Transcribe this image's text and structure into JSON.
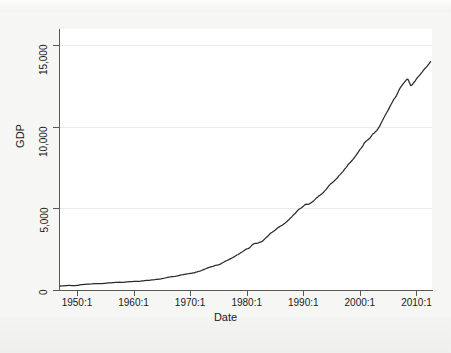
{
  "figure": {
    "background_color": "#f6f6f4",
    "plot_background_color": "#ffffff",
    "axis_color": "#585858",
    "grid_color": "#ececec",
    "line_color": "#2b2b2b"
  },
  "axis_titles": {
    "x": "Date",
    "y": "GDP"
  },
  "chart_data": {
    "type": "line",
    "title": "",
    "subtitle": "",
    "xlabel": "Date",
    "ylabel": "GDP",
    "xlim": [
      1947.0,
      2012.75
    ],
    "ylim": [
      0,
      16000
    ],
    "grid": true,
    "grid_axis": "y",
    "legend": false,
    "legend_position": "none",
    "x_tick_labels": [
      "1950:1",
      "1960:1",
      "1970:1",
      "1980:1",
      "1990:1",
      "2000:1",
      "2010:1"
    ],
    "x_tick_values": [
      1950,
      1960,
      1970,
      1980,
      1990,
      2000,
      2010
    ],
    "y_tick_labels": [
      "0",
      "5,000",
      "10,000",
      "15,000"
    ],
    "y_tick_values": [
      0,
      5000,
      10000,
      15000
    ],
    "series": [
      {
        "name": "GDP",
        "color": "#2b2b2b",
        "x": [
          1947.0,
          1947.25,
          1947.5,
          1947.75,
          1948.0,
          1948.25,
          1948.5,
          1948.75,
          1949.0,
          1949.25,
          1949.5,
          1949.75,
          1950.0,
          1950.25,
          1950.5,
          1950.75,
          1951.0,
          1951.25,
          1951.5,
          1951.75,
          1952.0,
          1952.25,
          1952.5,
          1952.75,
          1953.0,
          1953.25,
          1953.5,
          1953.75,
          1954.0,
          1954.25,
          1954.5,
          1954.75,
          1955.0,
          1955.25,
          1955.5,
          1955.75,
          1956.0,
          1956.25,
          1956.5,
          1956.75,
          1957.0,
          1957.25,
          1957.5,
          1957.75,
          1958.0,
          1958.25,
          1958.5,
          1958.75,
          1959.0,
          1959.25,
          1959.5,
          1959.75,
          1960.0,
          1960.25,
          1960.5,
          1960.75,
          1961.0,
          1961.25,
          1961.5,
          1961.75,
          1962.0,
          1962.25,
          1962.5,
          1962.75,
          1963.0,
          1963.25,
          1963.5,
          1963.75,
          1964.0,
          1964.25,
          1964.5,
          1964.75,
          1965.0,
          1965.25,
          1965.5,
          1965.75,
          1966.0,
          1966.25,
          1966.5,
          1966.75,
          1967.0,
          1967.25,
          1967.5,
          1967.75,
          1968.0,
          1968.25,
          1968.5,
          1968.75,
          1969.0,
          1969.25,
          1969.5,
          1969.75,
          1970.0,
          1970.25,
          1970.5,
          1970.75,
          1971.0,
          1971.25,
          1971.5,
          1971.75,
          1972.0,
          1972.25,
          1972.5,
          1972.75,
          1973.0,
          1973.25,
          1973.5,
          1973.75,
          1974.0,
          1974.25,
          1974.5,
          1974.75,
          1975.0,
          1975.25,
          1975.5,
          1975.75,
          1976.0,
          1976.25,
          1976.5,
          1976.75,
          1977.0,
          1977.25,
          1977.5,
          1977.75,
          1978.0,
          1978.25,
          1978.5,
          1978.75,
          1979.0,
          1979.25,
          1979.5,
          1979.75,
          1980.0,
          1980.25,
          1980.5,
          1980.75,
          1981.0,
          1981.25,
          1981.5,
          1981.75,
          1982.0,
          1982.25,
          1982.5,
          1982.75,
          1983.0,
          1983.25,
          1983.5,
          1983.75,
          1984.0,
          1984.25,
          1984.5,
          1984.75,
          1985.0,
          1985.25,
          1985.5,
          1985.75,
          1986.0,
          1986.25,
          1986.5,
          1986.75,
          1987.0,
          1987.25,
          1987.5,
          1987.75,
          1988.0,
          1988.25,
          1988.5,
          1988.75,
          1989.0,
          1989.25,
          1989.5,
          1989.75,
          1990.0,
          1990.25,
          1990.5,
          1990.75,
          1991.0,
          1991.25,
          1991.5,
          1991.75,
          1992.0,
          1992.25,
          1992.5,
          1992.75,
          1993.0,
          1993.25,
          1993.5,
          1993.75,
          1994.0,
          1994.25,
          1994.5,
          1994.75,
          1995.0,
          1995.25,
          1995.5,
          1995.75,
          1996.0,
          1996.25,
          1996.5,
          1996.75,
          1997.0,
          1997.25,
          1997.5,
          1997.75,
          1998.0,
          1998.25,
          1998.5,
          1998.75,
          1999.0,
          1999.25,
          1999.5,
          1999.75,
          2000.0,
          2000.25,
          2000.5,
          2000.75,
          2001.0,
          2001.25,
          2001.5,
          2001.75,
          2002.0,
          2002.25,
          2002.5,
          2002.75,
          2003.0,
          2003.25,
          2003.5,
          2003.75,
          2004.0,
          2004.25,
          2004.5,
          2004.75,
          2005.0,
          2005.25,
          2005.5,
          2005.75,
          2006.0,
          2006.25,
          2006.5,
          2006.75,
          2007.0,
          2007.25,
          2007.5,
          2007.75,
          2008.0,
          2008.25,
          2008.5,
          2008.75,
          2009.0,
          2009.25,
          2009.5,
          2009.75,
          2010.0,
          2010.25,
          2010.5,
          2010.75,
          2011.0,
          2011.25,
          2011.5,
          2011.75,
          2012.0,
          2012.25,
          2012.5
        ],
        "y": [
          243,
          246,
          250,
          260,
          266,
          273,
          277,
          281,
          275,
          271,
          273,
          267,
          281,
          290,
          309,
          324,
          333,
          340,
          349,
          358,
          360,
          361,
          368,
          381,
          390,
          392,
          391,
          385,
          384,
          385,
          391,
          401,
          412,
          421,
          430,
          438,
          441,
          446,
          452,
          461,
          470,
          472,
          479,
          473,
          466,
          469,
          481,
          492,
          503,
          513,
          513,
          517,
          527,
          527,
          529,
          527,
          533,
          542,
          554,
          563,
          576,
          585,
          591,
          596,
          606,
          614,
          624,
          632,
          646,
          657,
          668,
          674,
          696,
          712,
          730,
          751,
          774,
          787,
          799,
          815,
          825,
          833,
          847,
          864,
          887,
          907,
          922,
          938,
          960,
          976,
          990,
          998,
          1012,
          1025,
          1044,
          1044,
          1097,
          1115,
          1138,
          1162,
          1194,
          1232,
          1267,
          1303,
          1343,
          1375,
          1400,
          1437,
          1451,
          1479,
          1516,
          1527,
          1538,
          1569,
          1626,
          1672,
          1717,
          1771,
          1806,
          1847,
          1893,
          1939,
          1977,
          2031,
          2088,
          2144,
          2177,
          2232,
          2300,
          2349,
          2403,
          2468,
          2526,
          2536,
          2580,
          2673,
          2776,
          2829,
          2864,
          2860,
          2880,
          2919,
          2949,
          2983,
          3067,
          3149,
          3230,
          3305,
          3406,
          3490,
          3543,
          3600,
          3666,
          3740,
          3813,
          3870,
          3920,
          3969,
          4036,
          4095,
          4161,
          4248,
          4326,
          4416,
          4500,
          4601,
          4678,
          4763,
          4876,
          4947,
          5001,
          5059,
          5130,
          5220,
          5267,
          5246,
          5258,
          5323,
          5384,
          5434,
          5524,
          5619,
          5678,
          5772,
          5822,
          5889,
          5964,
          6060,
          6153,
          6268,
          6383,
          6478,
          6547,
          6614,
          6695,
          6781,
          6861,
          6994,
          7075,
          7168,
          7258,
          7387,
          7488,
          7595,
          7727,
          7803,
          7892,
          7989,
          8103,
          8217,
          8340,
          8470,
          8608,
          8697,
          8817,
          8998,
          9091,
          9160,
          9223,
          9302,
          9413,
          9560,
          9605,
          9707,
          9781,
          9907,
          10045,
          10225,
          10388,
          10561,
          10724,
          10880,
          11027,
          11197,
          11372,
          11523,
          11687,
          11792,
          11933,
          12122,
          12320,
          12446,
          12574,
          12677,
          12791,
          12894,
          12925,
          12725,
          12524,
          12579,
          12707,
          12797,
          12938,
          13054,
          13143,
          13255,
          13359,
          13478,
          13579,
          13665,
          13773,
          13875,
          14000
        ]
      }
    ],
    "annotations": []
  }
}
